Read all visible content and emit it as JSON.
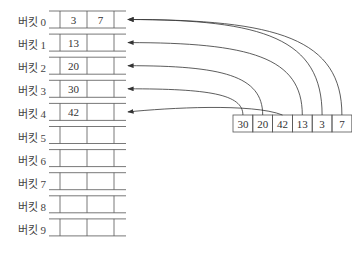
{
  "top_text": "",
  "buckets": [
    {
      "label": "버킷 0",
      "values": [
        "3",
        "7"
      ]
    },
    {
      "label": "버킷 1",
      "values": [
        "13",
        ""
      ]
    },
    {
      "label": "버킷 2",
      "values": [
        "20",
        ""
      ]
    },
    {
      "label": "버킷 3",
      "values": [
        "30",
        ""
      ]
    },
    {
      "label": "버킷 4",
      "values": [
        "42",
        ""
      ]
    },
    {
      "label": "버킷 5",
      "values": [
        "",
        ""
      ]
    },
    {
      "label": "버킷 6",
      "values": [
        "",
        ""
      ]
    },
    {
      "label": "버킷 7",
      "values": [
        "",
        ""
      ]
    },
    {
      "label": "버킷 8",
      "values": [
        "",
        ""
      ]
    },
    {
      "label": "버킷 9",
      "values": [
        "",
        ""
      ]
    }
  ],
  "input_array": [
    "30",
    "20",
    "42",
    "13",
    "3",
    "7"
  ],
  "arrows": [
    {
      "from": "30",
      "to_bucket": 3
    },
    {
      "from": "20",
      "to_bucket": 2
    },
    {
      "from": "42",
      "to_bucket": 4
    },
    {
      "from": "13",
      "to_bucket": 1
    },
    {
      "from": "3",
      "to_bucket": 0
    },
    {
      "from": "7",
      "to_bucket": 0
    }
  ],
  "colors": {
    "line": "#555555",
    "text": "#333333"
  }
}
